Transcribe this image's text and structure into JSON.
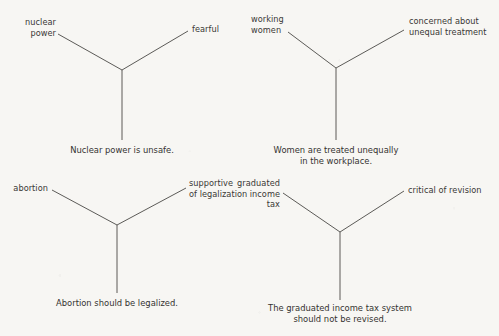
{
  "page": {
    "background_color": "#f7f6f3",
    "line_color": "#4a4845",
    "text_color": "#343230"
  },
  "diagrams": [
    {
      "id": "nuclear-power",
      "left_label": "nuclear\npower",
      "right_label": "fearful",
      "claim": "Nuclear power is unsafe."
    },
    {
      "id": "working-women",
      "left_label": "working\nwomen",
      "right_label": "concerned about\nunequal treatment",
      "claim": "Women are treated unequally\nin the workplace."
    },
    {
      "id": "abortion",
      "left_label": "abortion",
      "right_label": "supportive\nof legalization",
      "claim": "Abortion should be legalized."
    },
    {
      "id": "graduated-income-tax",
      "left_label": "graduated\nincome\ntax",
      "right_label": "critical of revision",
      "claim": "The graduated income tax system\nshould not be revised."
    }
  ]
}
